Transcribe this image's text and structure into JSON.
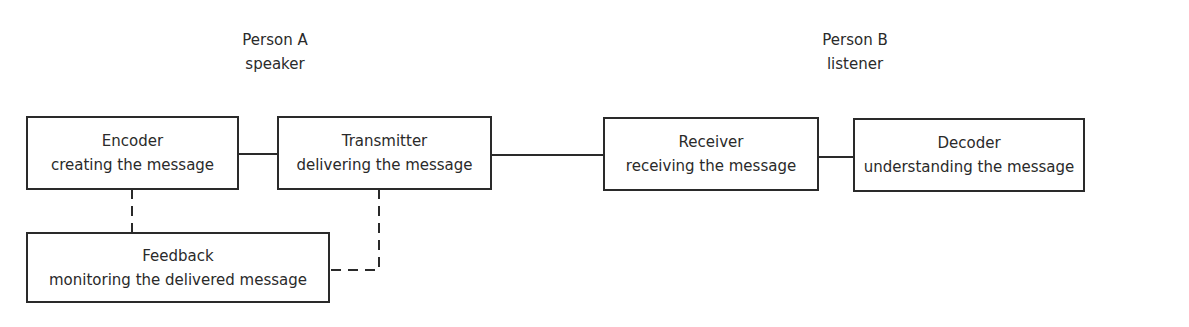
{
  "persons": [
    {
      "name": "Person A",
      "role": "speaker"
    },
    {
      "name": "Person B",
      "role": "listener"
    }
  ],
  "boxes": {
    "encoder": {
      "title": "Encoder",
      "subtitle": "creating the message"
    },
    "transmitter": {
      "title": "Transmitter",
      "subtitle": "delivering the message"
    },
    "receiver": {
      "title": "Receiver",
      "subtitle": "receiving the message"
    },
    "decoder": {
      "title": "Decoder",
      "subtitle": "understanding the message"
    },
    "feedback": {
      "title": "Feedback",
      "subtitle": "monitoring the delivered message"
    }
  },
  "connections": [
    {
      "from": "Encoder",
      "to": "Transmitter",
      "style": "solid"
    },
    {
      "from": "Transmitter",
      "to": "Receiver",
      "style": "solid"
    },
    {
      "from": "Receiver",
      "to": "Decoder",
      "style": "solid"
    },
    {
      "from": "Encoder",
      "to": "Feedback",
      "style": "dashed"
    },
    {
      "from": "Transmitter",
      "to": "Feedback",
      "style": "dashed"
    }
  ],
  "colors": {
    "line": "#2a2a2a",
    "background": "#ffffff"
  }
}
